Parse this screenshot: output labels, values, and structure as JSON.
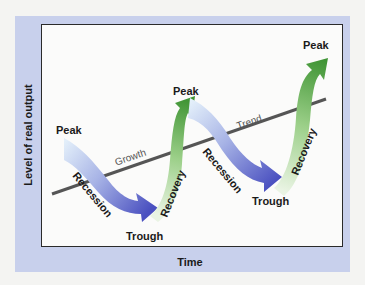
{
  "diagram": {
    "y_axis_label": "Level of real output",
    "x_axis_label": "Time",
    "trend_line": {
      "labels": [
        "Growth",
        "Trend"
      ],
      "color": "#555555"
    },
    "peaks": [
      {
        "label": "Peak"
      },
      {
        "label": "Peak"
      },
      {
        "label": "Peak"
      }
    ],
    "troughs": [
      {
        "label": "Trough"
      },
      {
        "label": "Trough"
      }
    ],
    "phases": [
      {
        "label": "Recession",
        "color": "#4a55c4"
      },
      {
        "label": "Recovery",
        "color": "#4e9a3a"
      },
      {
        "label": "Recession",
        "color": "#4a55c4"
      },
      {
        "label": "Recovery",
        "color": "#4e9a3a"
      }
    ],
    "colors": {
      "frame": "#c8d0ec",
      "panel": "#fbfbfa",
      "recession_start": "#e2eef8",
      "recession_end": "#4a50c0",
      "recovery_start": "#e6f2e0",
      "recovery_end": "#4a9a38"
    }
  }
}
